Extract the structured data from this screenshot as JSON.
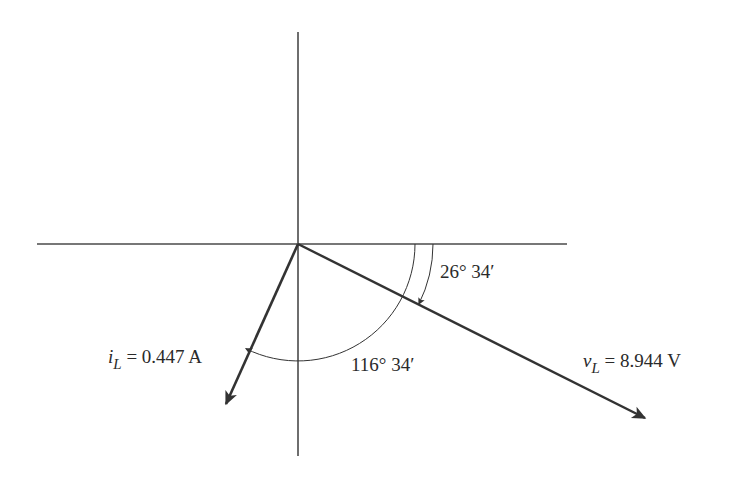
{
  "diagram": {
    "type": "phasor-diagram",
    "axes": {
      "origin": [
        298,
        244
      ],
      "horizontal": {
        "x1": 37,
        "x2": 567
      },
      "vertical": {
        "y1": 32,
        "y2": 456
      }
    },
    "phasors": [
      {
        "id": "vL",
        "symbol": "v",
        "subscript": "L",
        "equals": "=",
        "value": "8.944 V",
        "angle_deg": -26.57,
        "tip": [
          645,
          418
        ]
      },
      {
        "id": "iL",
        "symbol": "i",
        "subscript": "L",
        "equals": "=",
        "value": "0.447 A",
        "angle_deg": -116.57,
        "tip": [
          226,
          404
        ]
      }
    ],
    "angles": [
      {
        "id": "angle-vL",
        "label": "26° 34′",
        "radius": 135
      },
      {
        "id": "angle-iL",
        "label": "116° 34′",
        "radius": 117
      }
    ],
    "colors": {
      "line": "#333333",
      "axis": "#4a4a4a",
      "text": "#2a2a2a",
      "background": "#ffffff"
    }
  }
}
